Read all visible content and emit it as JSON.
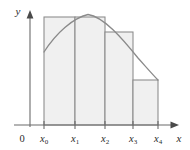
{
  "figure": {
    "axes": {
      "x_axis_label": "x",
      "y_axis_label": "y",
      "origin_label": "0"
    },
    "tick_labels": [
      {
        "base": "x",
        "sub": "0"
      },
      {
        "base": "x",
        "sub": "1"
      },
      {
        "base": "x",
        "sub": "2"
      },
      {
        "base": "x",
        "sub": "3"
      },
      {
        "base": "x",
        "sub": "4"
      }
    ],
    "colors": {
      "rect_fill": "#f0f0f0",
      "rect_stroke": "#8a8a8a",
      "curve_stroke": "#8a8a8a",
      "axis_stroke": "#6b6b6b",
      "text": "#2b2b2b",
      "background": "#ffffff"
    }
  },
  "chart_data": {
    "type": "area",
    "xlabel": "x",
    "ylabel": "y",
    "grid": false,
    "legend": null,
    "axis_origin_label": "0",
    "x_axis_pixel_y": 125,
    "y_axis_pixel_x": 30,
    "x_axis_extent_px": [
      14,
      178
    ],
    "y_axis_extent_px": [
      125,
      12
    ],
    "categories": [
      "x0",
      "x1",
      "x2",
      "x3",
      "x4"
    ],
    "partition_x_px": [
      44,
      75,
      105,
      133,
      158
    ],
    "bars": [
      {
        "label": "rect-1",
        "x_left_px": 44,
        "x_right_px": 75,
        "top_px": 17
      },
      {
        "label": "rect-2",
        "x_left_px": 75,
        "x_right_px": 105,
        "top_px": 17
      },
      {
        "label": "rect-3",
        "x_left_px": 105,
        "x_right_px": 133,
        "top_px": 32
      },
      {
        "label": "rect-4",
        "x_left_px": 133,
        "x_right_px": 158,
        "top_px": 80
      }
    ],
    "bar_heights_px": [
      108,
      108,
      93,
      45
    ],
    "curve": {
      "description": "concave-down arc rising from left endpoint to an interior maximum then falling",
      "start_px": [
        44,
        52
      ],
      "peak_px": [
        88,
        14
      ],
      "end_px": [
        158,
        80
      ],
      "path": "M 44,52 C 56,33 73,18 88,14.5 C 104,17 122,38 138,58 C 147,68 154,76 158,80"
    }
  }
}
